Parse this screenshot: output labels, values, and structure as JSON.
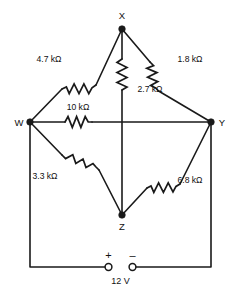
{
  "diagram": {
    "background_color": "#ffffff",
    "line_color": "#1a1a1a"
  },
  "nodes": [
    {
      "id": "X",
      "label": "X"
    },
    {
      "id": "W",
      "label": "W"
    },
    {
      "id": "Y",
      "label": "Y"
    },
    {
      "id": "Z",
      "label": "Z"
    }
  ],
  "resistors": [
    {
      "id": "r-wx",
      "label": "4.7 kΩ",
      "between": "W-X"
    },
    {
      "id": "r-xy",
      "label": "1.8 kΩ",
      "between": "X-Y"
    },
    {
      "id": "r-xz",
      "label": "2.7 kΩ",
      "between": "X-Z"
    },
    {
      "id": "r-wy",
      "label": "10 kΩ",
      "between": "W-Y"
    },
    {
      "id": "r-wz",
      "label": "3.3 kΩ",
      "between": "W-Z"
    },
    {
      "id": "r-zy",
      "label": "6.8 kΩ",
      "between": "Z-Y"
    }
  ],
  "source": {
    "voltage": "12 V",
    "positive_sign": "+",
    "negative_sign": "–"
  }
}
